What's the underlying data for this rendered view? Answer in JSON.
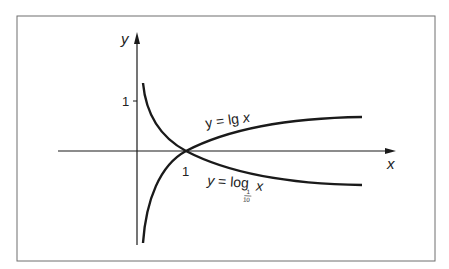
{
  "figure": {
    "axes": {
      "x_label": "x",
      "y_label": "y",
      "x_tick_label": "1",
      "y_tick_label": "1"
    },
    "curves": [
      {
        "name": "lg",
        "label_prefix": "y = lg ",
        "label_var": "x"
      },
      {
        "name": "log_one_tenth",
        "label_prefix": "y = log",
        "label_base_num": "1",
        "label_base_den": "10",
        "label_var": "x"
      }
    ],
    "colors": {
      "border": "#6f6f6f",
      "ink": "#1a1a1a"
    }
  }
}
